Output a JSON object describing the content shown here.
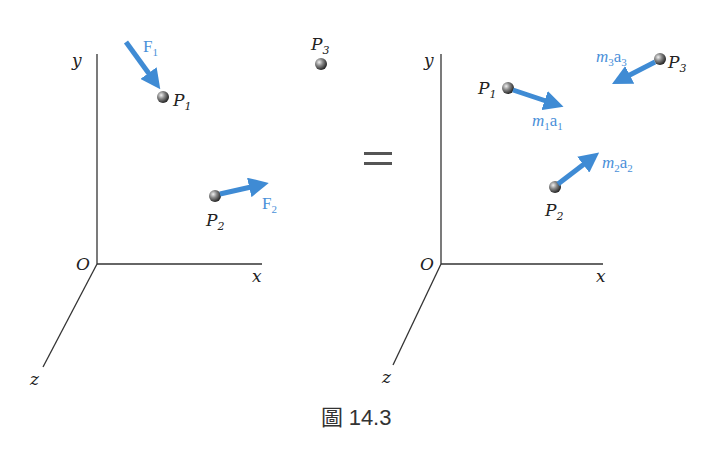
{
  "diagram": {
    "colors": {
      "vector": "#3f8bd4",
      "axis": "#333333",
      "label": "#222222",
      "vector_label": "#4a90d9"
    },
    "left_panel": {
      "axes": {
        "y": "y",
        "x": "x",
        "z": "z",
        "origin": "O"
      },
      "particles": [
        {
          "name": "P",
          "sub": "1",
          "force": "F",
          "force_sub": "1"
        },
        {
          "name": "P",
          "sub": "2",
          "force": "F",
          "force_sub": "2"
        },
        {
          "name": "P",
          "sub": "3"
        }
      ]
    },
    "equals_sign": "=",
    "right_panel": {
      "axes": {
        "y": "y",
        "x": "x",
        "z": "z",
        "origin": "O"
      },
      "particles": [
        {
          "name": "P",
          "sub": "1",
          "m": "m",
          "m_sub": "1",
          "a": "a",
          "a_sub": "1"
        },
        {
          "name": "P",
          "sub": "2",
          "m": "m",
          "m_sub": "2",
          "a": "a",
          "a_sub": "2"
        },
        {
          "name": "P",
          "sub": "3",
          "m": "m",
          "m_sub": "3",
          "a": "a",
          "a_sub": "3"
        }
      ]
    },
    "caption": "圖 14.3"
  }
}
